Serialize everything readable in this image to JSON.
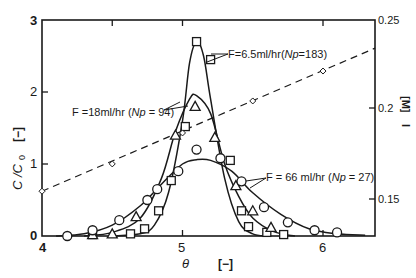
{
  "chart_data": {
    "type": "scatter",
    "title": "",
    "xlabel": "θ",
    "xunit": "[−]",
    "ylabel": "C / C0",
    "yunit": "[−]",
    "y2label": "I",
    "y2unit": "[M]",
    "xlim": [
      4,
      6.37
    ],
    "ylim": [
      0,
      3
    ],
    "y2lim": [
      0.141,
      0.25
    ],
    "x_ticks": [
      4,
      5,
      6
    ],
    "y_ticks": [
      0,
      1,
      2,
      3
    ],
    "y2_ticks": [
      0.15,
      0.2,
      0.25
    ],
    "grid": false,
    "legend_position": "inline annotations",
    "series": [
      {
        "name": "F=6.5ml/hr (Np=183)",
        "marker": "square",
        "label_text": "F=6.5ml/hr(",
        "label_italic": "Np",
        "label_tail": "=183)",
        "x": [
          4.36,
          4.63,
          4.73,
          4.83,
          4.92,
          5.02,
          5.1,
          5.2,
          5.34,
          5.42,
          5.47,
          5.6,
          5.72
        ],
        "y": [
          0.02,
          0.03,
          0.1,
          0.35,
          0.77,
          1.52,
          2.7,
          2.45,
          1.05,
          0.35,
          0.13,
          0.05,
          0.02
        ],
        "curve_x": [
          4.5,
          4.7,
          4.8,
          4.9,
          5.0,
          5.05,
          5.1,
          5.15,
          5.2,
          5.3,
          5.4,
          5.5,
          5.6
        ],
        "curve_y": [
          0,
          0.03,
          0.15,
          0.6,
          1.6,
          2.4,
          2.7,
          2.5,
          1.9,
          0.8,
          0.2,
          0.03,
          0
        ]
      },
      {
        "name": "F=18ml/hr (Np=94)",
        "marker": "triangle",
        "label_text": "F =18ml/hr (",
        "label_italic": "Np",
        "label_tail": " = 94)",
        "x": [
          4.36,
          4.5,
          4.67,
          4.95,
          5.09,
          5.23,
          5.38,
          5.5,
          5.63
        ],
        "y": [
          0.02,
          0.03,
          0.27,
          1.4,
          1.8,
          1.37,
          0.7,
          0.35,
          0.12
        ],
        "curve_x": [
          4.3,
          4.5,
          4.7,
          4.85,
          4.95,
          5.05,
          5.1,
          5.2,
          5.3,
          5.4,
          5.5,
          5.65,
          5.8
        ],
        "curve_y": [
          0,
          0.05,
          0.25,
          0.8,
          1.45,
          1.9,
          1.95,
          1.7,
          1.0,
          0.55,
          0.25,
          0.06,
          0
        ]
      },
      {
        "name": "F=66ml/hr (Np=27)",
        "marker": "circle",
        "label_text": "F = 66 ml/hr (",
        "label_italic": "Np",
        "label_tail": " = 27)",
        "x": [
          4.18,
          4.36,
          4.55,
          4.75,
          4.82,
          4.97,
          5.1,
          5.27,
          5.42,
          5.58,
          5.75,
          5.94,
          6.1
        ],
        "y": [
          0.0,
          0.08,
          0.22,
          0.5,
          0.65,
          0.9,
          1.2,
          1.08,
          0.76,
          0.4,
          0.19,
          0.08,
          0.05
        ],
        "curve_x": [
          4.1,
          4.3,
          4.5,
          4.7,
          4.85,
          5.0,
          5.1,
          5.2,
          5.35,
          5.5,
          5.7,
          5.9,
          6.1,
          6.3
        ],
        "curve_y": [
          0,
          0.03,
          0.15,
          0.42,
          0.72,
          1.0,
          1.06,
          1.05,
          0.9,
          0.6,
          0.3,
          0.1,
          0.03,
          0.01
        ]
      },
      {
        "name": "I [M] (salt concentration, right axis)",
        "marker": "small-circle",
        "line": "dashed",
        "axis": "y2",
        "x": [
          4.0,
          4.5,
          5.0,
          5.5,
          6.0
        ],
        "y": [
          0.156,
          0.171,
          0.188,
          0.204,
          0.221
        ],
        "line_start": [
          4.0,
          0.156
        ],
        "line_end": [
          6.37,
          0.234
        ]
      }
    ]
  },
  "labels": {
    "y_axis_title": "C /C",
    "y_axis_sub": "0",
    "y_axis_unit": "[−]",
    "x_axis_title": "θ",
    "x_axis_unit": "[−]",
    "y2_axis_title": "I",
    "y2_axis_unit": "[M]",
    "tick_y0": "0",
    "tick_y1": "1",
    "tick_y2": "2",
    "tick_y3": "3",
    "tick_x4": "4",
    "tick_x5": "5",
    "tick_x6": "6",
    "tick_y2_015": "0.15",
    "tick_y2_020": "0.2",
    "tick_y2_025": "0.25"
  }
}
